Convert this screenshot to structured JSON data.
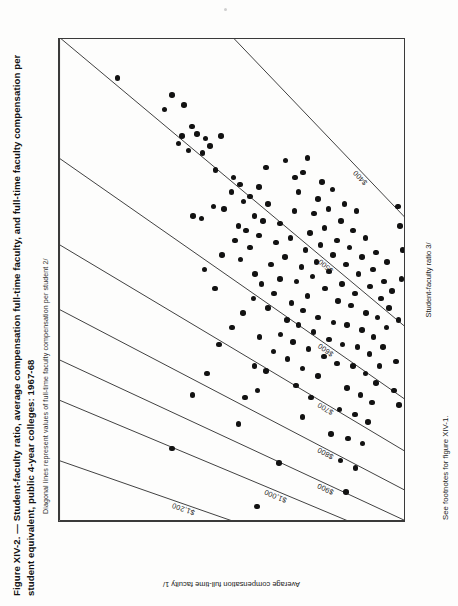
{
  "figure": {
    "title": "Figure XIV-2. — Student-faculty ratio, average compensation full-time faculty, and full-time faculty compensation per student equivalent, public 4-year colleges: 1967-68",
    "subtitle": "Diagonal lines represent values of full-time faculty compensation per student 2/",
    "footnote": "See footnotes for figure XIV-1.",
    "y_axis_caption": "Average compensation full-time faculty 1/",
    "x_axis_caption": "Student-faculty ratio 3/"
  },
  "chart_data": {
    "type": "scatter",
    "title": "Figure XIV-2. — Student-faculty ratio, average compensation full-time faculty, and full-time faculty compensation per student equivalent, public 4-year colleges: 1967-68",
    "subtitle": "Diagonal lines represent values of full-time faculty compensation per student 2/",
    "xlabel": "Student-faculty ratio 3/",
    "ylabel": "Average compensation full-time faculty 1/",
    "xlim": [
      10,
      30
    ],
    "ylim": [
      9000,
      15000
    ],
    "grid": false,
    "legend": null,
    "x_ticks": [
      10,
      11,
      12,
      13,
      14,
      15,
      16,
      17,
      18,
      19,
      20,
      21,
      22,
      23,
      24,
      25,
      26,
      27,
      28,
      29,
      30
    ],
    "x_tick_labels": [
      "10",
      "11",
      "12",
      "13",
      "14",
      "15",
      "16",
      "17",
      "18",
      "19",
      "20",
      "21",
      "22",
      "23",
      "24",
      "25",
      "26",
      "27",
      "28",
      "29",
      "30"
    ],
    "y_ticks": [
      9000,
      9500,
      10000,
      10500,
      11000,
      11500,
      12000,
      12500,
      13000,
      13500,
      14000,
      14500,
      15000
    ],
    "y_major_ticks": [
      9000,
      10000,
      11000,
      12000,
      13000,
      14000,
      15000
    ],
    "y_tick_labels": [
      "$9,000",
      "$10,000",
      "$11,000",
      "$12,000",
      "$13,000",
      "$14,000",
      "$15,000"
    ],
    "iso_lines": {
      "description": "Diagonal lines of constant full-time faculty compensation per student equivalent: compensation = ratio x value",
      "values": [
        400,
        500,
        600,
        700,
        800,
        900,
        1000,
        1200
      ],
      "labels": [
        "$400",
        "$500",
        "$600",
        "$700",
        "$800",
        "$900",
        "$1,000",
        "$1,200"
      ]
    },
    "points": [
      [
        28.3,
        13990
      ],
      [
        27.0,
        13180
      ],
      [
        25.6,
        12930
      ],
      [
        25.3,
        12760
      ],
      [
        25.9,
        12870
      ],
      [
        26.3,
        12700
      ],
      [
        27.6,
        13050
      ],
      [
        27.2,
        12840
      ],
      [
        25.2,
        12520
      ],
      [
        26.0,
        12610
      ],
      [
        25.8,
        12470
      ],
      [
        24.5,
        12290
      ],
      [
        25.9,
        12200
      ],
      [
        24.2,
        11980
      ],
      [
        25.5,
        12390
      ],
      [
        23.9,
        11870
      ],
      [
        22.5,
        12540
      ],
      [
        23.0,
        12330
      ],
      [
        22.9,
        12150
      ],
      [
        23.6,
        12020
      ],
      [
        22.2,
        11900
      ],
      [
        23.2,
        11810
      ],
      [
        23.4,
        11700
      ],
      [
        22.0,
        11770
      ],
      [
        22.6,
        11620
      ],
      [
        21.6,
        11960
      ],
      [
        21.0,
        12180
      ],
      [
        20.4,
        12480
      ],
      [
        19.6,
        12300
      ],
      [
        20.8,
        11860
      ],
      [
        21.3,
        11700
      ],
      [
        20.2,
        11610
      ],
      [
        21.8,
        11540
      ],
      [
        22.4,
        11470
      ],
      [
        23.1,
        11390
      ],
      [
        20.6,
        11330
      ],
      [
        21.5,
        11250
      ],
      [
        22.3,
        11180
      ],
      [
        19.8,
        11500
      ],
      [
        19.2,
        11640
      ],
      [
        18.6,
        11820
      ],
      [
        18.0,
        12010
      ],
      [
        17.3,
        12230
      ],
      [
        16.1,
        12440
      ],
      [
        15.2,
        12690
      ],
      [
        14.0,
        11900
      ],
      [
        13.0,
        13050
      ],
      [
        12.4,
        11200
      ],
      [
        15.1,
        11780
      ],
      [
        16.4,
        11620
      ],
      [
        17.6,
        11530
      ],
      [
        18.8,
        11390
      ],
      [
        19.4,
        11280
      ],
      [
        20.0,
        11180
      ],
      [
        20.9,
        11090
      ],
      [
        21.7,
        11000
      ],
      [
        22.8,
        10930
      ],
      [
        23.6,
        10860
      ],
      [
        24.4,
        10780
      ],
      [
        25.0,
        10700
      ],
      [
        19.0,
        10980
      ],
      [
        19.9,
        10890
      ],
      [
        20.5,
        10810
      ],
      [
        21.2,
        10740
      ],
      [
        21.9,
        10660
      ],
      [
        22.7,
        10590
      ],
      [
        23.3,
        10520
      ],
      [
        24.0,
        10450
      ],
      [
        18.3,
        11060
      ],
      [
        17.7,
        11170
      ],
      [
        17.0,
        11290
      ],
      [
        16.2,
        11420
      ],
      [
        15.4,
        11570
      ],
      [
        19.3,
        10700
      ],
      [
        20.1,
        10620
      ],
      [
        20.7,
        10550
      ],
      [
        21.4,
        10480
      ],
      [
        22.1,
        10410
      ],
      [
        22.9,
        10340
      ],
      [
        23.7,
        10270
      ],
      [
        18.7,
        10780
      ],
      [
        18.1,
        10860
      ],
      [
        17.4,
        10950
      ],
      [
        16.7,
        11050
      ],
      [
        19.6,
        10400
      ],
      [
        20.3,
        10330
      ],
      [
        21.0,
        10260
      ],
      [
        21.6,
        10190
      ],
      [
        22.4,
        10120
      ],
      [
        23.1,
        10060
      ],
      [
        18.4,
        10520
      ],
      [
        17.8,
        10600
      ],
      [
        17.1,
        10690
      ],
      [
        16.3,
        10790
      ],
      [
        15.6,
        10900
      ],
      [
        19.1,
        10180
      ],
      [
        19.8,
        10110
      ],
      [
        20.6,
        10040
      ],
      [
        21.3,
        9980
      ],
      [
        22.0,
        9920
      ],
      [
        22.8,
        9860
      ],
      [
        18.2,
        10250
      ],
      [
        17.5,
        10330
      ],
      [
        16.8,
        10420
      ],
      [
        16.0,
        10520
      ],
      [
        15.1,
        10640
      ],
      [
        14.3,
        10790
      ],
      [
        19.4,
        9880
      ],
      [
        20.2,
        9820
      ],
      [
        20.9,
        9760
      ],
      [
        21.7,
        9700
      ],
      [
        18.9,
        9950
      ],
      [
        18.1,
        10020
      ],
      [
        17.3,
        10100
      ],
      [
        16.5,
        10190
      ],
      [
        19.7,
        9620
      ],
      [
        20.4,
        9570
      ],
      [
        21.1,
        9520
      ],
      [
        18.6,
        9690
      ],
      [
        17.9,
        9760
      ],
      [
        17.2,
        9840
      ],
      [
        16.4,
        9920
      ],
      [
        15.5,
        10020
      ],
      [
        14.6,
        10150
      ],
      [
        13.6,
        10300
      ],
      [
        19.2,
        9430
      ],
      [
        19.9,
        9380
      ],
      [
        20.7,
        9330
      ],
      [
        18.4,
        9490
      ],
      [
        17.6,
        9560
      ],
      [
        16.9,
        9630
      ],
      [
        16.1,
        9700
      ],
      [
        15.2,
        9790
      ],
      [
        14.4,
        9880
      ],
      [
        13.4,
        10000
      ],
      [
        12.5,
        10130
      ],
      [
        18.0,
        9340
      ],
      [
        18.8,
        9290
      ],
      [
        19.5,
        9240
      ],
      [
        17.2,
        9400
      ],
      [
        16.4,
        9460
      ],
      [
        15.7,
        9520
      ],
      [
        14.9,
        9590
      ],
      [
        14.1,
        9660
      ],
      [
        13.2,
        9750
      ],
      [
        12.2,
        9870
      ],
      [
        11.2,
        10040
      ],
      [
        10.6,
        11580
      ],
      [
        14.8,
        9120
      ],
      [
        20.0,
        9080
      ],
      [
        21.2,
        9060
      ],
      [
        22.2,
        9100
      ],
      [
        23.0,
        9140
      ],
      [
        18.3,
        9130
      ],
      [
        16.6,
        9170
      ],
      [
        15.4,
        9210
      ],
      [
        24.2,
        10920
      ],
      [
        24.9,
        11080
      ],
      [
        23.8,
        11540
      ],
      [
        24.6,
        11420
      ],
      [
        22.6,
        12680
      ]
    ]
  }
}
